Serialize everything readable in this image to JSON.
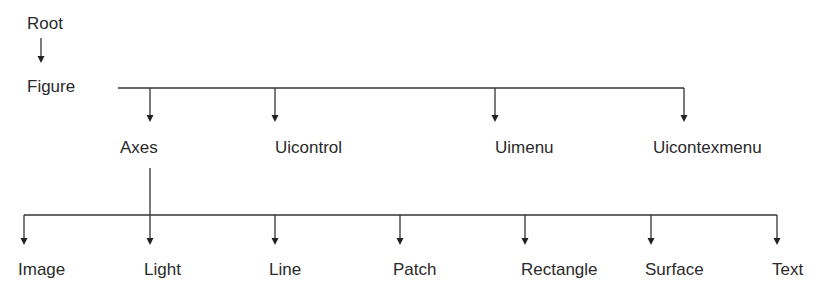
{
  "diagram": {
    "type": "hierarchy-tree",
    "line_color": "#333333",
    "text_color": "#2a2a2a",
    "root": {
      "label": "Root"
    },
    "figure": {
      "label": "Figure"
    },
    "figure_children": [
      {
        "label": "Axes"
      },
      {
        "label": "Uicontrol"
      },
      {
        "label": "Uimenu"
      },
      {
        "label": "Uicontexmenu"
      }
    ],
    "axes_children": [
      {
        "label": "Image"
      },
      {
        "label": "Light"
      },
      {
        "label": "Line"
      },
      {
        "label": "Patch"
      },
      {
        "label": "Rectangle"
      },
      {
        "label": "Surface"
      },
      {
        "label": "Text"
      }
    ],
    "edges": [
      [
        "Root",
        "Figure"
      ],
      [
        "Figure",
        "Axes"
      ],
      [
        "Figure",
        "Uicontrol"
      ],
      [
        "Figure",
        "Uimenu"
      ],
      [
        "Figure",
        "Uicontexmenu"
      ],
      [
        "Axes",
        "Image"
      ],
      [
        "Axes",
        "Light"
      ],
      [
        "Axes",
        "Line"
      ],
      [
        "Axes",
        "Patch"
      ],
      [
        "Axes",
        "Rectangle"
      ],
      [
        "Axes",
        "Surface"
      ],
      [
        "Axes",
        "Text"
      ]
    ]
  }
}
